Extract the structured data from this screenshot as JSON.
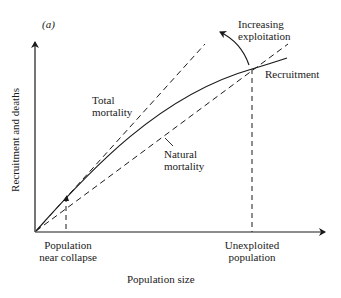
{
  "figure": {
    "panel_label": "(a)",
    "x_axis_label": "Population size",
    "y_axis_label": "Recruitment and deaths",
    "labels": {
      "total_mortality_line1": "Total",
      "total_mortality_line2": "mortality",
      "natural_mortality_line1": "Natural",
      "natural_mortality_line2": "mortality",
      "recruitment": "Recruitment",
      "increasing_exploitation_line1": "Increasing",
      "increasing_exploitation_line2": "exploitation",
      "near_collapse_line1": "Population",
      "near_collapse_line2": "near collapse",
      "unexploited_line1": "Unexploited",
      "unexploited_line2": "population"
    },
    "colors": {
      "ink": "#1a1a1a",
      "background": "#ffffff"
    }
  }
}
